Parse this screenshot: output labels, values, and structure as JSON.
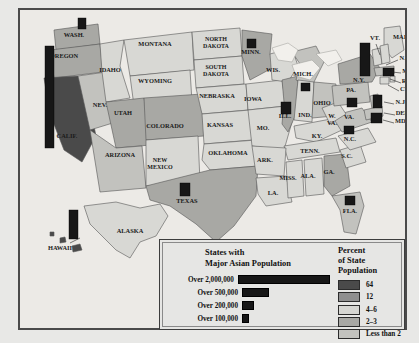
{
  "map": {
    "title_hidden": "States with Major Asian Population",
    "states": [
      {
        "abbr": "WASH.",
        "name": "Washington",
        "label": "WASH.",
        "x": 54,
        "y": 27,
        "tier": 3,
        "bar": {
          "x": 58,
          "y": 8,
          "w": 8,
          "h": 11
        }
      },
      {
        "abbr": "OREGON",
        "name": "Oregon",
        "label": "OREGON",
        "x": 44,
        "y": 48,
        "tier": 3,
        "bar": null
      },
      {
        "abbr": "CALIF.",
        "name": "California",
        "label": "CALIF.",
        "x": 47,
        "y": 128,
        "tier": 1,
        "bar": {
          "x": 25,
          "y": 36,
          "w": 9,
          "h": 102
        }
      },
      {
        "abbr": "NEV.",
        "name": "Nevada",
        "label": "NEV.",
        "x": 80,
        "y": 97,
        "tier": 4,
        "bar": null
      },
      {
        "abbr": "IDAHO",
        "name": "Idaho",
        "label": "IDAHO",
        "x": 90,
        "y": 62,
        "tier": 5,
        "bar": null
      },
      {
        "abbr": "MONTANA",
        "name": "Montana",
        "label": "MONTANA",
        "x": 135,
        "y": 36,
        "tier": 5,
        "bar": null
      },
      {
        "abbr": "WYOMING",
        "name": "Wyoming",
        "label": "WYOMING",
        "x": 135,
        "y": 73,
        "tier": 5,
        "bar": null
      },
      {
        "abbr": "UTAH",
        "name": "Utah",
        "label": "UTAH",
        "x": 103,
        "y": 105,
        "tier": 3,
        "bar": null
      },
      {
        "abbr": "ARIZONA",
        "name": "Arizona",
        "label": "ARIZONA",
        "x": 100,
        "y": 147,
        "tier": 4,
        "bar": null
      },
      {
        "abbr": "COLORADO",
        "name": "Colorado",
        "label": "COLORADO",
        "x": 145,
        "y": 118,
        "tier": 3,
        "bar": null
      },
      {
        "abbr": "NEW MEXICO",
        "name": "New Mexico",
        "label": "NEW\nMEXICO",
        "x": 140,
        "y": 152,
        "tier": 5,
        "bar": null
      },
      {
        "abbr": "NORTH DAKOTA",
        "name": "North Dakota",
        "label": "NORTH\nDAKOTA",
        "x": 196,
        "y": 31,
        "tier": 5,
        "bar": null
      },
      {
        "abbr": "SOUTH DAKOTA",
        "name": "South Dakota",
        "label": "SOUTH\nDAKOTA",
        "x": 196,
        "y": 59,
        "tier": 5,
        "bar": null
      },
      {
        "abbr": "NEBRASKA",
        "name": "Nebraska",
        "label": "NEBRASKA",
        "x": 197,
        "y": 88,
        "tier": 5,
        "bar": null
      },
      {
        "abbr": "KANSAS",
        "name": "Kansas",
        "label": "KANSAS",
        "x": 200,
        "y": 117,
        "tier": 5,
        "bar": null
      },
      {
        "abbr": "OKLAHOMA",
        "name": "Oklahoma",
        "label": "OKLAHOMA",
        "x": 208,
        "y": 145,
        "tier": 5,
        "bar": null
      },
      {
        "abbr": "TEXAS",
        "name": "Texas",
        "label": "TEXAS",
        "x": 167,
        "y": 193,
        "tier": 3,
        "bar": {
          "x": 160,
          "y": 173,
          "w": 10,
          "h": 13
        }
      },
      {
        "abbr": "MINN.",
        "name": "Minnesota",
        "label": "MINN.",
        "x": 231,
        "y": 44,
        "tier": 3,
        "bar": {
          "x": 227,
          "y": 29,
          "w": 9,
          "h": 9
        }
      },
      {
        "abbr": "IOWA",
        "name": "Iowa",
        "label": "IOWA",
        "x": 233,
        "y": 91,
        "tier": 5,
        "bar": null
      },
      {
        "abbr": "MO.",
        "name": "Missouri",
        "label": "MO.",
        "x": 243,
        "y": 120,
        "tier": 5,
        "bar": null
      },
      {
        "abbr": "WIS.",
        "name": "Wis.",
        "label": "WIS.",
        "x": 253,
        "y": 62,
        "tier": 5,
        "bar": null
      },
      {
        "abbr": "ILL.",
        "name": "Illinois",
        "label": "ILL.",
        "x": 265,
        "y": 108,
        "tier": 3,
        "bar": {
          "x": 261,
          "y": 92,
          "w": 10,
          "h": 12
        }
      },
      {
        "abbr": "MICH.",
        "name": "Michigan",
        "label": "MICH.",
        "x": 283,
        "y": 66,
        "tier": 4,
        "bar": {
          "x": 281,
          "y": 73,
          "w": 9,
          "h": 8
        }
      },
      {
        "abbr": "IND.",
        "name": "Indiana",
        "label": "IND.",
        "x": 285,
        "y": 107,
        "tier": 5,
        "bar": null
      },
      {
        "abbr": "OHIO",
        "name": "Ohio",
        "label": "OHIO",
        "x": 302,
        "y": 95,
        "tier": 4,
        "bar": null
      },
      {
        "abbr": "KY.",
        "name": "Kentucky",
        "label": "KY.",
        "x": 297,
        "y": 128,
        "tier": 5,
        "bar": null
      },
      {
        "abbr": "TENN.",
        "name": "Tennessee",
        "label": "TENN.",
        "x": 290,
        "y": 143,
        "tier": 5,
        "bar": null
      },
      {
        "abbr": "ARK.",
        "name": "Arkansas",
        "label": "ARK.",
        "x": 245,
        "y": 152,
        "tier": 5,
        "bar": null
      },
      {
        "abbr": "LA.",
        "name": "Louisiana",
        "label": "LA.",
        "x": 253,
        "y": 185,
        "tier": 5,
        "bar": null
      },
      {
        "abbr": "MISS.",
        "name": "Mississippi",
        "label": "MISS.",
        "x": 268,
        "y": 170,
        "tier": 5,
        "bar": null
      },
      {
        "abbr": "ALA.",
        "name": "Alabama",
        "label": "ALA.",
        "x": 288,
        "y": 168,
        "tier": 5,
        "bar": null
      },
      {
        "abbr": "GA.",
        "name": "Ga.",
        "label": "GA.",
        "x": 309,
        "y": 164,
        "tier": 3,
        "bar": null
      },
      {
        "abbr": "FLA.",
        "name": "Florida",
        "label": "FLA.",
        "x": 330,
        "y": 203,
        "tier": 4,
        "bar": {
          "x": 325,
          "y": 186,
          "w": 10,
          "h": 9
        }
      },
      {
        "abbr": "S.C.",
        "name": "S.C.",
        "label": "S.C.",
        "x": 327,
        "y": 148,
        "tier": 5,
        "bar": null
      },
      {
        "abbr": "N.C.",
        "name": "N.C.",
        "label": "N.C.",
        "x": 330,
        "y": 131,
        "tier": 5,
        "bar": null
      },
      {
        "abbr": "VA.",
        "name": "Va.",
        "label": "VA.",
        "x": 329,
        "y": 109,
        "tier": 4,
        "bar": {
          "x": 324,
          "y": 116,
          "w": 10,
          "h": 8
        }
      },
      {
        "abbr": "W. VA.",
        "name": "West Virginia",
        "label": "W.\nVA.",
        "x": 312,
        "y": 108,
        "tier": 5,
        "bar": null
      },
      {
        "abbr": "PA.",
        "name": "Pennsylvania",
        "label": "PA.",
        "x": 331,
        "y": 82,
        "tier": 4,
        "bar": {
          "x": 327,
          "y": 88,
          "w": 10,
          "h": 9
        }
      },
      {
        "abbr": "N.Y.",
        "name": "New York",
        "label": "N.Y.",
        "x": 339,
        "y": 72,
        "tier": 3,
        "bar": {
          "x": 340,
          "y": 33,
          "w": 10,
          "h": 33
        }
      },
      {
        "abbr": "VT.",
        "name": "Vt.",
        "label": "VT.",
        "x": 355,
        "y": 30,
        "tier": 5,
        "bar": null
      },
      {
        "abbr": "MAINE",
        "name": "Maine",
        "label": "MAINE",
        "x": 384,
        "y": 29,
        "tier": 5,
        "bar": null
      },
      {
        "abbr": "N.H.",
        "name": "N.H.",
        "label": "N.H.",
        "x": 386,
        "y": 50,
        "tier": 5,
        "bar": null
      },
      {
        "abbr": "MASS.",
        "name": "Mass.",
        "label": "MASS.",
        "x": 392,
        "y": 63,
        "tier": 4,
        "bar": {
          "x": 363,
          "y": 58,
          "w": 11,
          "h": 8
        }
      },
      {
        "abbr": "R.I.",
        "name": "R.I.",
        "label": "R.I.",
        "x": 387,
        "y": 73,
        "tier": 5,
        "bar": null
      },
      {
        "abbr": "CT.",
        "name": "CT.",
        "label": "CT.",
        "x": 385,
        "y": 81,
        "tier": 5,
        "bar": null
      },
      {
        "abbr": "N.J.",
        "name": "N.J.",
        "label": "N.J.",
        "x": 381,
        "y": 94,
        "tier": 4,
        "bar": {
          "x": 353,
          "y": 85,
          "w": 9,
          "h": 13
        }
      },
      {
        "abbr": "DEL.",
        "name": "Del.",
        "label": "DEL.",
        "x": 383,
        "y": 105,
        "tier": 5,
        "bar": null
      },
      {
        "abbr": "MD.",
        "name": "Md.",
        "label": "MD.",
        "x": 381,
        "y": 113,
        "tier": 4,
        "bar": {
          "x": 351,
          "y": 103,
          "w": 11,
          "h": 10
        }
      },
      {
        "abbr": "ALASKA",
        "name": "Alaska",
        "label": "ALASKA",
        "x": 110,
        "y": 223,
        "tier": 5,
        "bar": null
      },
      {
        "abbr": "HAWAII",
        "name": "Hawaii",
        "label": "HAWAII",
        "x": 40,
        "y": 240,
        "tier": 1,
        "bar": {
          "x": 49,
          "y": 200,
          "w": 9,
          "h": 29
        }
      }
    ]
  },
  "legend": {
    "bars_title_line1": "States with",
    "bars_title_line2": "Major Asian Population",
    "bars": [
      {
        "label": "Over 2,000,000",
        "width": 95
      },
      {
        "label": "Over 500,000",
        "width": 25
      },
      {
        "label": "Over 200,000",
        "width": 10
      },
      {
        "label": "Over 100,000",
        "width": 5
      }
    ],
    "pct_title_line1": "Percent",
    "pct_title_line2": "of State",
    "pct_title_line3": "Population",
    "pct_items": [
      {
        "label": "64",
        "color": "#4a4a4a"
      },
      {
        "label": "12",
        "color": "#8f8f8f"
      },
      {
        "label": "4–6",
        "color": "#d6d6d2"
      },
      {
        "label": "2–3",
        "color": "#a8a8a4"
      },
      {
        "label": "Less than 2",
        "color": "#c2c2be"
      }
    ]
  },
  "colors": {
    "tier1": "#4a4a4a",
    "tier2": "#8f8f8f",
    "tier3": "#a8a8a4",
    "tier4": "#c2c2be",
    "tier5": "#d8d8d4",
    "water": "#eceae6",
    "lake": "#f2f0ec",
    "outline": "#555555",
    "bar": "#171717"
  }
}
